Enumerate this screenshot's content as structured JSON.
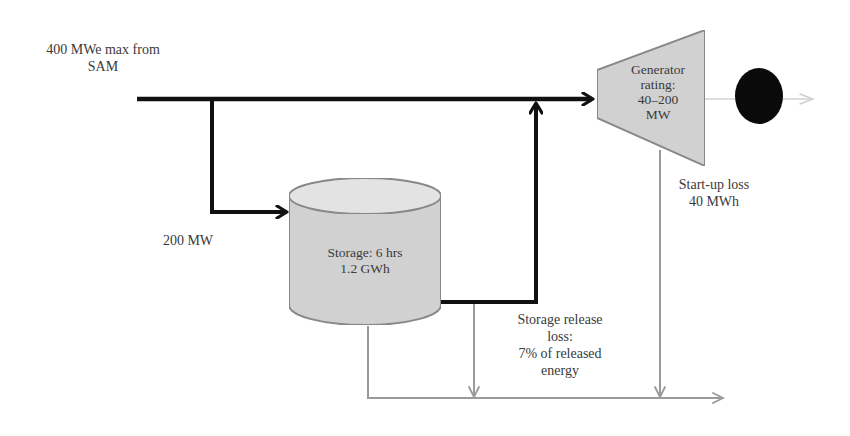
{
  "diagram": {
    "type": "energy-flow-schematic",
    "labels": {
      "source": [
        "400 MWe max from",
        "SAM"
      ],
      "charge_rate": "200 MW",
      "storage": [
        "Storage: 6 hrs",
        "1.2 GWh"
      ],
      "generator": [
        "Generator",
        "rating:",
        "40–200",
        "MW"
      ],
      "startup_loss": [
        "Start-up loss",
        "40 MWh"
      ],
      "release_loss": [
        "Storage release",
        "loss:",
        "7% of released",
        "energy"
      ]
    },
    "nodes": [
      {
        "id": "source",
        "label": "400 MWe max from SAM"
      },
      {
        "id": "storage",
        "label": "Storage: 6 hrs 1.2 GWh",
        "shape": "cylinder"
      },
      {
        "id": "generator",
        "label": "Generator rating: 40–200 MW",
        "shape": "trapezoid"
      },
      {
        "id": "grid",
        "label": "",
        "shape": "filled-circle"
      }
    ],
    "edges": [
      {
        "from": "source",
        "to": "generator",
        "style": "thick-black-arrow"
      },
      {
        "from": "source",
        "to": "storage",
        "label": "200 MW",
        "style": "thick-black-arrow"
      },
      {
        "from": "storage",
        "to": "generator",
        "style": "thick-black-arrow"
      },
      {
        "from": "generator",
        "to": "grid",
        "style": "thin-gray-arrow"
      },
      {
        "from": "storage",
        "to": "loss-line",
        "label": "Storage release loss: 7% of released energy",
        "style": "thin-gray-arrow"
      },
      {
        "from": "generator",
        "to": "loss-line",
        "label": "Start-up loss 40 MWh",
        "style": "thin-gray-arrow"
      }
    ],
    "colors": {
      "main_flow": "#111111",
      "loss_flow": "#9a9a9a",
      "shape_fill": "#d4d4d4",
      "shape_stroke": "#8a8a8a",
      "grid_node": "#0a0a0a",
      "text": "#3a3a3a"
    }
  }
}
